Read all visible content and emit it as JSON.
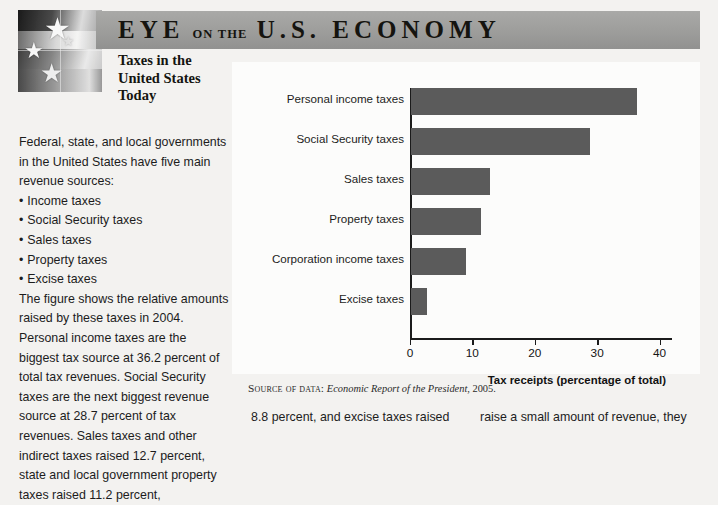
{
  "banner": {
    "eye": "EYE",
    "on_the": "ON THE",
    "economy": "U.S.  ECONOMY",
    "bg_color": "#9d9d9b"
  },
  "flag": {
    "alt": "grayscale american flag with stars"
  },
  "subtitle": "Taxes in the\nUnited States\nToday",
  "article": {
    "intro": "Federal, state, and local governments in the United States have five main revenue sources:",
    "bullets": [
      "Income taxes",
      "Social Security taxes",
      "Sales taxes",
      "Property taxes",
      "Excise taxes"
    ],
    "body": "The figure shows the relative amounts raised by these taxes in 2004. Personal income taxes are the biggest tax source at 36.2 percent of total tax revenues. Social Security taxes are the next biggest revenue source at 28.7 percent of tax revenues. Sales taxes and other indirect taxes raised 12.7 percent, state and local government property taxes raised 11.2 percent,",
    "cont_middle": "8.8 percent, and excise taxes raised",
    "cont_right": "raise a small amount of revenue, they"
  },
  "source": {
    "prefix": "Source of data:",
    "title": "Economic Report of the President",
    "year": ", 2005."
  },
  "chart_data": {
    "type": "bar",
    "orientation": "horizontal",
    "title": "",
    "xlabel": "Tax receipts (percentage of total)",
    "ylabel": "",
    "categories": [
      "Personal income taxes",
      "Social Security taxes",
      "Sales taxes",
      "Property taxes",
      "Corporation income taxes",
      "Excise taxes"
    ],
    "values": [
      36.2,
      28.7,
      12.7,
      11.2,
      8.8,
      2.6
    ],
    "xlim": [
      0,
      42
    ],
    "xticks": [
      0,
      10,
      20,
      30,
      40
    ],
    "xticklabels": [
      "0",
      "10",
      "20",
      "30",
      "40"
    ],
    "grid": false,
    "legend": false,
    "bar_color": "#5b5b5b"
  }
}
